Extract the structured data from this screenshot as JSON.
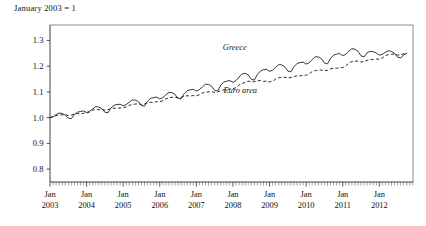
{
  "caption": "January 2003 = 1",
  "chart_data": {
    "type": "line",
    "title": "January 2003 = 1",
    "xlabel": "",
    "ylabel": "",
    "grid": false,
    "legend_position": "inline-annotation",
    "xlim": [
      2003.0,
      2012.92
    ],
    "ylim": [
      0.75,
      1.36
    ],
    "yticks": [
      0.8,
      0.9,
      1.0,
      1.1,
      1.2,
      1.3
    ],
    "ytick_labels": [
      "0.8",
      "0.9",
      "1.0",
      "1.1",
      "1.2",
      "1.3"
    ],
    "xticks": [
      2003,
      2004,
      2005,
      2006,
      2007,
      2008,
      2009,
      2010,
      2011,
      2012
    ],
    "xtick_labels": [
      {
        "month": "Jan",
        "year": "2003"
      },
      {
        "month": "Jan",
        "year": "2004"
      },
      {
        "month": "Jan",
        "year": "2005"
      },
      {
        "month": "Jan",
        "year": "2006"
      },
      {
        "month": "Jan",
        "year": "2007"
      },
      {
        "month": "Jan",
        "year": "2008"
      },
      {
        "month": "Jan",
        "year": "2009"
      },
      {
        "month": "Jan",
        "year": "2010"
      },
      {
        "month": "Jan",
        "year": "2011"
      },
      {
        "month": "Jan",
        "year": "2012"
      }
    ],
    "minor_tick_interval_months": 1,
    "annotations": [
      {
        "text": "Greece",
        "x": 2008.05,
        "y": 1.262,
        "style": "italic"
      },
      {
        "text": "Euro area",
        "x": 2008.2,
        "y": 1.095,
        "style": "italic"
      }
    ],
    "series": [
      {
        "name": "Greece",
        "style": "solid",
        "color": "#1f1f1f",
        "x_start": 2003.0,
        "x_step_months": 1,
        "values": [
          1.0,
          1.003,
          1.012,
          1.018,
          1.016,
          1.01,
          0.998,
          0.996,
          1.012,
          1.021,
          1.024,
          1.026,
          1.02,
          1.025,
          1.034,
          1.043,
          1.041,
          1.035,
          1.021,
          1.019,
          1.038,
          1.048,
          1.051,
          1.052,
          1.046,
          1.051,
          1.06,
          1.069,
          1.068,
          1.062,
          1.047,
          1.045,
          1.064,
          1.075,
          1.078,
          1.08,
          1.073,
          1.078,
          1.089,
          1.098,
          1.097,
          1.09,
          1.075,
          1.073,
          1.093,
          1.105,
          1.108,
          1.11,
          1.103,
          1.109,
          1.12,
          1.13,
          1.129,
          1.122,
          1.106,
          1.104,
          1.126,
          1.138,
          1.142,
          1.144,
          1.137,
          1.144,
          1.158,
          1.17,
          1.172,
          1.166,
          1.149,
          1.146,
          1.168,
          1.181,
          1.186,
          1.188,
          1.18,
          1.184,
          1.196,
          1.206,
          1.205,
          1.198,
          1.181,
          1.178,
          1.198,
          1.21,
          1.214,
          1.216,
          1.208,
          1.213,
          1.226,
          1.237,
          1.236,
          1.229,
          1.212,
          1.209,
          1.23,
          1.243,
          1.247,
          1.249,
          1.241,
          1.246,
          1.258,
          1.268,
          1.266,
          1.258,
          1.24,
          1.236,
          1.252,
          1.258,
          1.256,
          1.252,
          1.243,
          1.246,
          1.254,
          1.26,
          1.257,
          1.25,
          1.235,
          1.232,
          1.244,
          1.25
        ]
      },
      {
        "name": "Euro area",
        "style": "dashed",
        "color": "#1f1f1f",
        "x_start": 2003.0,
        "x_step_months": 1,
        "values": [
          1.0,
          1.004,
          1.008,
          1.011,
          1.011,
          1.012,
          1.008,
          1.01,
          1.014,
          1.016,
          1.015,
          1.017,
          1.018,
          1.022,
          1.029,
          1.032,
          1.031,
          1.032,
          1.029,
          1.031,
          1.035,
          1.037,
          1.036,
          1.038,
          1.038,
          1.042,
          1.048,
          1.051,
          1.053,
          1.054,
          1.051,
          1.053,
          1.058,
          1.06,
          1.059,
          1.062,
          1.062,
          1.066,
          1.073,
          1.077,
          1.079,
          1.08,
          1.077,
          1.079,
          1.083,
          1.085,
          1.084,
          1.086,
          1.085,
          1.089,
          1.096,
          1.099,
          1.1,
          1.101,
          1.098,
          1.1,
          1.105,
          1.108,
          1.109,
          1.112,
          1.112,
          1.117,
          1.127,
          1.133,
          1.137,
          1.142,
          1.139,
          1.14,
          1.143,
          1.144,
          1.141,
          1.142,
          1.139,
          1.142,
          1.15,
          1.155,
          1.157,
          1.157,
          1.154,
          1.156,
          1.16,
          1.162,
          1.162,
          1.165,
          1.165,
          1.17,
          1.179,
          1.183,
          1.184,
          1.185,
          1.182,
          1.184,
          1.189,
          1.192,
          1.192,
          1.194,
          1.195,
          1.201,
          1.212,
          1.218,
          1.219,
          1.22,
          1.216,
          1.218,
          1.223,
          1.226,
          1.226,
          1.228,
          1.227,
          1.232,
          1.241,
          1.245,
          1.246,
          1.247,
          1.243,
          1.244,
          1.248,
          1.25
        ]
      }
    ]
  }
}
